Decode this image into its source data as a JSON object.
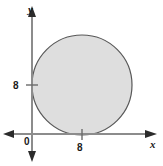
{
  "figure": {
    "name": "coordinate-plane-with-shaded-circle",
    "background_color": "#ffffff"
  },
  "axes": {
    "x": {
      "label": "x",
      "label_icon": "x-axis-label",
      "arrow_left": "arrow-left-icon",
      "arrow_right": "arrow-right-icon",
      "color": "#808080",
      "ticks": [
        {
          "value": "8",
          "position_px": 82
        }
      ]
    },
    "y": {
      "label": "y",
      "label_icon": "y-axis-label",
      "arrow_up": "arrow-up-icon",
      "arrow_down": "arrow-down-icon",
      "color": "#808080",
      "ticks": [
        {
          "value": "8",
          "position_px": 85
        }
      ]
    },
    "origin": {
      "label": "0"
    }
  },
  "chart_data": {
    "type": "scatter",
    "title": "",
    "xlabel": "x",
    "ylabel": "y",
    "xlim": [
      -3,
      19
    ],
    "ylim": [
      -2,
      21
    ],
    "grid": false,
    "legend": null,
    "xticks": [
      "8"
    ],
    "yticks": [
      "8"
    ],
    "shapes": [
      {
        "kind": "circle",
        "center": [
          8,
          8
        ],
        "radius": 8,
        "fill": "#dedede",
        "stroke": "#585858",
        "stroke_width": 1,
        "note": "circle tangent to both x-axis and y-axis"
      }
    ]
  },
  "colors": {
    "circle_fill": "#dedede",
    "circle_stroke": "#585858",
    "axis": "#8c8c8c",
    "text": "#1a1a1a"
  }
}
